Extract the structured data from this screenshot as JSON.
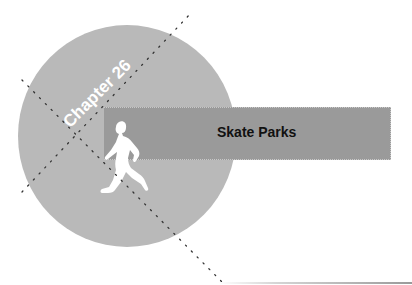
{
  "chapter": {
    "label": "Chapter 26"
  },
  "banner": {
    "title": "Skate Parks"
  },
  "illustration": {
    "figure": "runner-silhouette-icon",
    "circle_color": "#b9b9b9",
    "banner_color": "#9a9a9a",
    "text_color_chapter": "#ffffff",
    "text_color_title": "#111111"
  }
}
